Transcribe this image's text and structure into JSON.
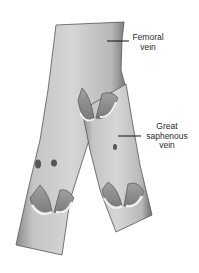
{
  "figure": {
    "labels": {
      "femoral_line1": "Femoral",
      "femoral_line2": "vein",
      "saphenous_line1": "Great",
      "saphenous_line2": "saphenous",
      "saphenous_line3": "vein"
    }
  }
}
